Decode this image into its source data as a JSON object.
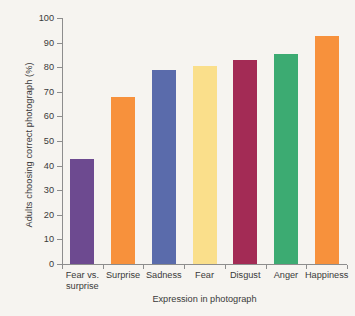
{
  "chart_data": {
    "type": "bar",
    "title": "",
    "xlabel": "Expression in photograph",
    "ylabel": "Adults choosing correct photograph (%)",
    "categories": [
      "Fear vs.\nsurprise",
      "Surprise",
      "Sadness",
      "Fear",
      "Disgust",
      "Anger",
      "Happiness"
    ],
    "values": [
      42.5,
      68,
      79,
      80.5,
      83,
      85.5,
      92.5
    ],
    "colors": [
      "#6d4a90",
      "#f7913c",
      "#5a6bab",
      "#fadf8b",
      "#a32b55",
      "#3cab72",
      "#f7913c"
    ],
    "ylim": [
      0,
      100
    ],
    "yticks": [
      0,
      10,
      20,
      30,
      40,
      50,
      60,
      70,
      80,
      90,
      100
    ],
    "ytick_labels": [
      "0",
      "10",
      "20",
      "30",
      "40",
      "50",
      "60",
      "70",
      "80",
      "90",
      "100"
    ],
    "grid": false,
    "legend": false
  },
  "style": {
    "background": "#f6f4f0",
    "axis_color": "#8d8d8d",
    "text_color": "#3a3a3a"
  }
}
